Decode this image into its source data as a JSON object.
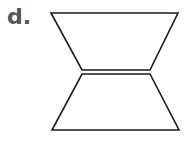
{
  "label": "d.",
  "figure": {
    "stroke_color": "#1a1a1a",
    "top_trapezoid": {
      "points": "51,13 178,13 150,70 82,70"
    },
    "bottom_trapezoid": {
      "points": "82,74 150,74 179,130 52,130"
    }
  }
}
